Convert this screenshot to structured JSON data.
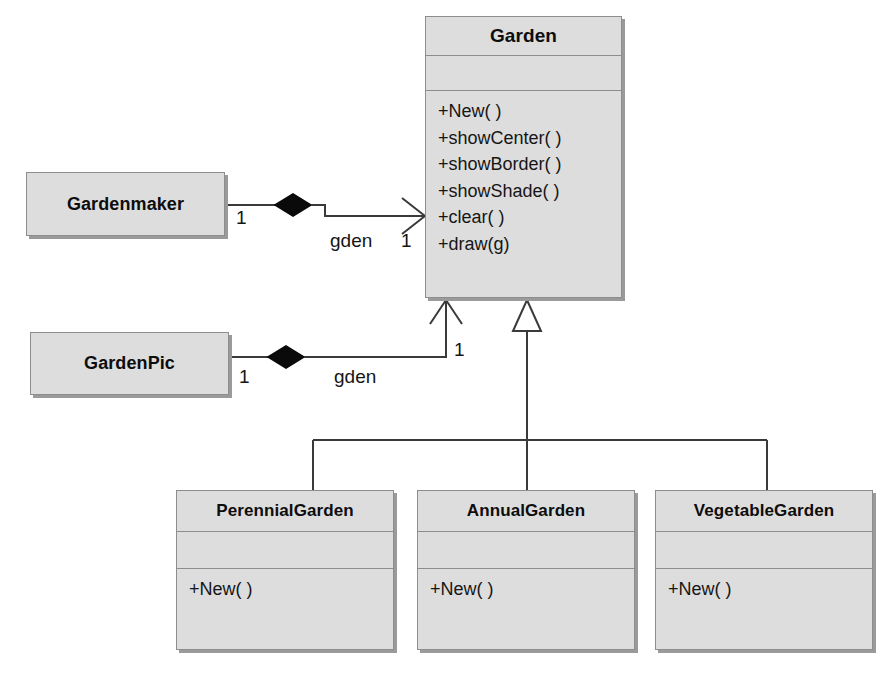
{
  "diagram": {
    "type": "uml-class-diagram",
    "background_color": "#ffffff",
    "box_fill_color": "#dddddd",
    "box_border_color": "#8d8d8d",
    "box_shadow_color": "#9a9a9a",
    "line_color": "#3a3a3a",
    "text_color": "#0d0d0d"
  },
  "classes": {
    "garden": {
      "name": "Garden",
      "attributes": [],
      "operations": [
        "+New( )",
        "+showCenter( )",
        "+showBorder( )",
        "+showShade( )",
        "+clear( )",
        "+draw(g)"
      ]
    },
    "gardenmaker": {
      "name": "Gardenmaker",
      "attributes": [],
      "operations": []
    },
    "gardenpic": {
      "name": "GardenPic",
      "attributes": [],
      "operations": []
    },
    "perennialgarden": {
      "name": "PerennialGarden",
      "attributes": [],
      "operations": [
        "+New( )"
      ]
    },
    "annualgarden": {
      "name": "AnnualGarden",
      "attributes": [],
      "operations": [
        "+New( )"
      ]
    },
    "vegetablegarden": {
      "name": "VegetableGarden",
      "attributes": [],
      "operations": [
        "+New( )"
      ]
    }
  },
  "relationships": {
    "gardenmaker_to_garden": {
      "kind": "aggregation-directed",
      "source": "Gardenmaker",
      "target": "Garden",
      "source_multiplicity": "1",
      "target_multiplicity": "1",
      "role_label": "gden"
    },
    "gardenpic_to_garden": {
      "kind": "aggregation-directed",
      "source": "GardenPic",
      "target": "Garden",
      "source_multiplicity": "1",
      "target_multiplicity": "1",
      "role_label": "gden"
    },
    "generalizations": {
      "kind": "generalization",
      "parent": "Garden",
      "children": [
        "PerennialGarden",
        "AnnualGarden",
        "VegetableGarden"
      ]
    }
  }
}
